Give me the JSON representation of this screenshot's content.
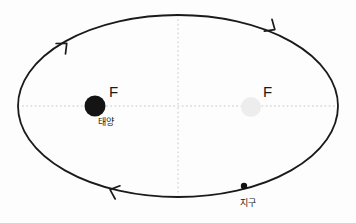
{
  "figure": {
    "type": "orbital-diagram",
    "background_color": "#fdfdfd",
    "width": 356,
    "height": 223
  },
  "labels": {
    "focus_left": "F",
    "focus_right": "F",
    "sun": "태양",
    "earth": "지구"
  },
  "colors": {
    "orbit_stroke": "#1a1a1a",
    "sun_fill": "#141414",
    "empty_focus_fill": "#ededed",
    "axis_dotted": "#d8d8d8",
    "earth_fill": "#111111",
    "text": "#1a1a1a"
  },
  "geometry": {
    "ellipse": {
      "cx": 178,
      "cy": 106,
      "rx": 160,
      "ry": 91,
      "stroke_width": 1.8
    },
    "sun": {
      "cx": 95,
      "cy": 106,
      "r": 10.5
    },
    "empty_focus": {
      "cx": 251,
      "cy": 107,
      "r": 10.0
    },
    "earth": {
      "cx": 244,
      "cy": 186,
      "r": 3.2
    },
    "major_axis": {
      "x1": 18,
      "y1": 106,
      "x2": 338,
      "y2": 106
    },
    "minor_axis": {
      "x1": 178,
      "y1": 15,
      "x2": 178,
      "y2": 198
    }
  },
  "arrows": {
    "direction": "clockwise",
    "markers": [
      {
        "name": "arrow-top-left",
        "x": 66,
        "y": 44,
        "angle": -42
      },
      {
        "name": "arrow-top-right",
        "x": 272,
        "y": 30,
        "angle": 38
      },
      {
        "name": "arrow-bottom-left",
        "x": 111,
        "y": 189,
        "angle": 198
      },
      {
        "name": "arrow-bottom-right",
        "x": 292,
        "y": 168,
        "angle": 140
      }
    ]
  }
}
